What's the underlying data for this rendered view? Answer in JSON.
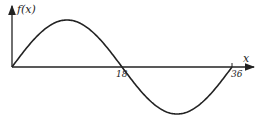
{
  "chart_data": {
    "type": "line",
    "title": "",
    "xlabel": "x",
    "ylabel": "f(x)",
    "x_ticks": [
      "18",
      "36"
    ],
    "x": [
      0,
      4.5,
      9,
      13.5,
      18,
      22.5,
      27,
      31.5,
      36
    ],
    "values": [
      0,
      0.71,
      1,
      0.71,
      0,
      -0.71,
      -1,
      -0.71,
      0
    ],
    "grid": false,
    "legend": null
  },
  "labels": {
    "y_axis": "f(x)",
    "x_axis": "x",
    "tick_18": "18",
    "tick_36": "36"
  },
  "colors": {
    "stroke": "#222222",
    "background": "#ffffff"
  }
}
